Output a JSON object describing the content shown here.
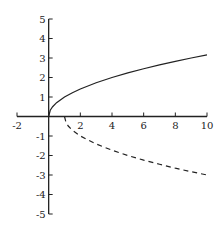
{
  "chart_data": {
    "type": "line",
    "title": "",
    "xlabel": "",
    "ylabel": "",
    "xlim": [
      -2,
      10
    ],
    "ylim": [
      -5,
      5
    ],
    "grid": false,
    "legend": null,
    "x_ticks": [
      -2,
      2,
      4,
      6,
      8,
      10
    ],
    "y_ticks": [
      5,
      4,
      3,
      2,
      1,
      -1,
      -2,
      -3,
      -4,
      -5
    ],
    "series": [
      {
        "name": "upper branch (solid)",
        "style": "solid",
        "color": "#222222",
        "x": [
          0,
          0.1,
          0.25,
          0.5,
          1,
          1.5,
          2,
          3,
          4,
          5,
          6,
          7,
          8,
          9,
          10
        ],
        "y": [
          0,
          0.32,
          0.5,
          0.71,
          1,
          1.22,
          1.41,
          1.73,
          2,
          2.24,
          2.45,
          2.65,
          2.83,
          3,
          3.16
        ]
      },
      {
        "name": "lower branch (dashed)",
        "style": "dashed",
        "color": "#222222",
        "x": [
          1,
          1.1,
          1.25,
          1.5,
          2,
          3,
          4,
          5,
          6,
          7,
          8,
          9,
          10
        ],
        "y": [
          0,
          -0.32,
          -0.5,
          -0.71,
          -1,
          -1.41,
          -1.73,
          -2,
          -2.24,
          -2.45,
          -2.65,
          -2.83,
          -3
        ]
      }
    ]
  },
  "plot_box": {
    "x0_px": 17,
    "x1_px": 207,
    "y_top_px": 19,
    "y_bottom_px": 214,
    "origin_x_px": 49,
    "origin_y_px": 117
  }
}
